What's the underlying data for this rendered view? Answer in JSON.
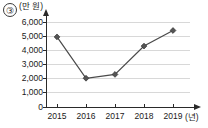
{
  "item_number": "③",
  "chart_data": {
    "type": "line",
    "title": "",
    "subtitle": "",
    "xlabel": "(년)",
    "ylabel": "(만 원)",
    "categories": [
      "2015",
      "2016",
      "2017",
      "2018",
      "2019"
    ],
    "values": [
      4950,
      2030,
      2300,
      4300,
      5400
    ],
    "series": [
      {
        "name": "",
        "values": [
          4950,
          2030,
          2300,
          4300,
          5400
        ]
      }
    ],
    "y_ticks": [
      0,
      1000,
      2000,
      3000,
      4000,
      5000,
      6000
    ],
    "y_tick_labels": [
      "0",
      "1,000",
      "2,000",
      "3,000",
      "4,000",
      "5,000",
      "6,000"
    ],
    "x_tick_labels": [
      "2015",
      "2016",
      "2017",
      "2018",
      "2019"
    ],
    "ylim": [
      0,
      6000
    ],
    "grid": true,
    "grid_axis": "y",
    "legend": false,
    "legend_position": "none",
    "marker": "diamond",
    "line_color": "#4a4a4a",
    "marker_color": "#555555",
    "grid_color": "#d8d8d8",
    "axis_color": "#2a2a2a",
    "background_color": "#ffffff"
  }
}
